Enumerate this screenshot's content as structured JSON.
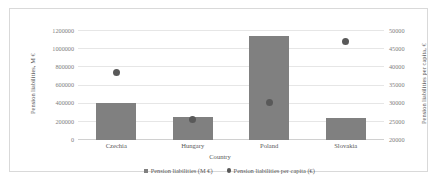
{
  "chart_data": {
    "type": "bar",
    "title": "",
    "categories": [
      "Czechia",
      "Hungary",
      "Poland",
      "Slovakia"
    ],
    "xlabel": "Country",
    "ylabel": "Pension liabilities, M €",
    "y2label": "Pension liabilities per capita, €",
    "ylim": [
      0,
      1200000
    ],
    "y2lim": [
      20000,
      50000
    ],
    "yticks": [
      "0",
      "200000",
      "400000",
      "600000",
      "800000",
      "1000000",
      "1200000"
    ],
    "ytick_values": [
      0,
      200000,
      400000,
      600000,
      800000,
      1000000,
      1200000
    ],
    "y2ticks": [
      "20000",
      "25000",
      "30000",
      "35000",
      "40000",
      "45000",
      "50000"
    ],
    "y2tick_values": [
      20000,
      25000,
      30000,
      35000,
      40000,
      45000,
      50000
    ],
    "grid": true,
    "legend_position": "bottom",
    "series": [
      {
        "name": "Pension liabilities (M €)",
        "type": "bar",
        "axis": "left",
        "color": "#808080",
        "values": [
          405000,
          255000,
          1140000,
          245000
        ]
      },
      {
        "name": "Pension liabilities per capita (€)",
        "type": "scatter",
        "axis": "right",
        "color": "#595959",
        "values": [
          38500,
          25700,
          30300,
          47000
        ]
      }
    ]
  },
  "legend": {
    "items": [
      {
        "label": "Pension liabilities (M €)",
        "marker": "square"
      },
      {
        "label": "Pension liabilities per capita (€)",
        "marker": "circle"
      }
    ]
  },
  "colors": {
    "bar": "#808080",
    "dot": "#595959",
    "grid": "#e6e6e6",
    "frame": "#d9d9d9",
    "text": "#595959",
    "tick_text": "#808080"
  }
}
